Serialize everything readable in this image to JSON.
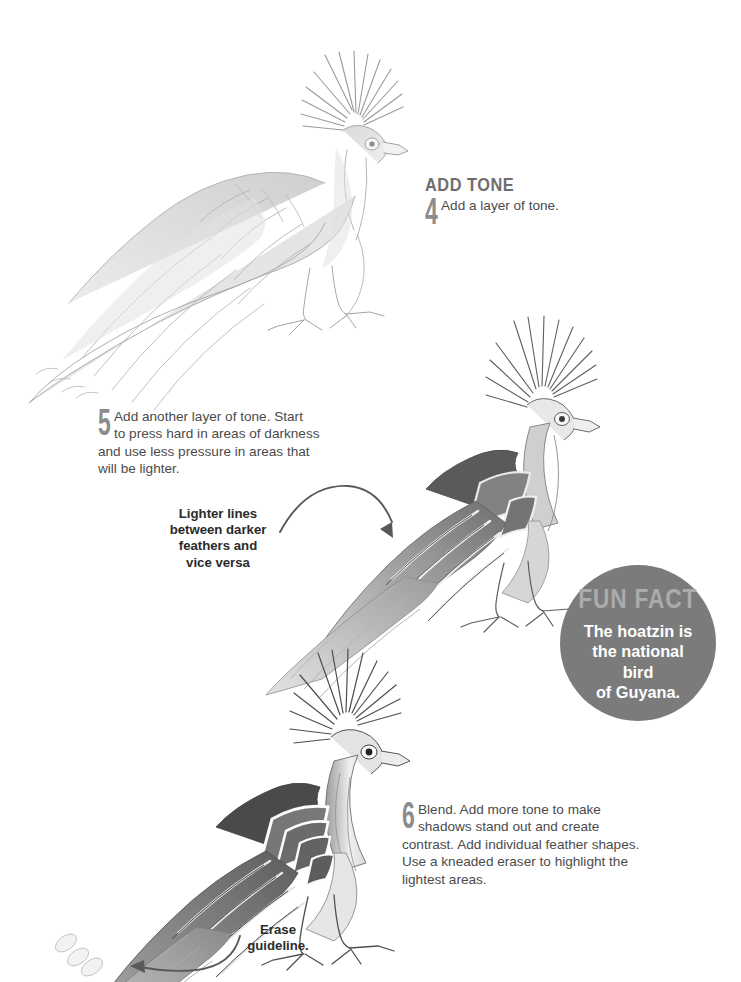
{
  "page": {
    "background": "#ffffff",
    "text_color": "#4b4b4b",
    "heading_color": "#6e6e6e",
    "number_color": "#8c8c8c",
    "accent_gray": "#7b7b7b"
  },
  "steps": [
    {
      "heading": "ADD TONE",
      "number": "4",
      "lines": [
        "Add a layer of tone."
      ],
      "drawing": "hoatzin-sketch-light"
    },
    {
      "heading": "",
      "number": "5",
      "lines": [
        "Add another layer of tone. Start",
        "to press hard in areas of darkness",
        "and use less pressure in areas that",
        "will be lighter."
      ],
      "drawing": "hoatzin-sketch-mid"
    },
    {
      "heading": "",
      "number": "6",
      "lines": [
        "Blend. Add more tone to make",
        "shadows stand out and create",
        "contrast. Add individual feather shapes.",
        "Use a kneaded eraser to highlight the",
        "lightest areas."
      ],
      "drawing": "hoatzin-sketch-finished"
    }
  ],
  "callouts": [
    {
      "id": "lighter-lines",
      "lines": [
        "Lighter lines",
        "between darker",
        "feathers and",
        "vice versa"
      ]
    },
    {
      "id": "erase-guideline",
      "lines": [
        "Erase",
        "guideline."
      ]
    }
  ],
  "fun_fact": {
    "title": "FUN FACT",
    "lines": [
      "The hoatzin is",
      "the national bird",
      "of Guyana."
    ],
    "circle_color": "#7b7b7b",
    "title_color": "#ababab",
    "body_color": "#ffffff"
  }
}
